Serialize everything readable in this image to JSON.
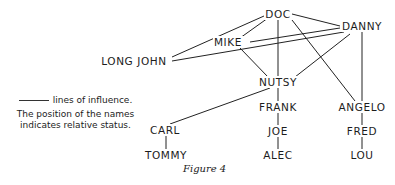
{
  "legend": {
    "line_label": "lines of influence.",
    "note_line1": "The position of the names",
    "note_line2": "indicates relative status."
  },
  "caption": "Figure 4",
  "nodes": {
    "doc": {
      "label": "DOC",
      "x": 278,
      "y": 14
    },
    "danny": {
      "label": "DANNY",
      "x": 362,
      "y": 26
    },
    "mike": {
      "label": "MIKE",
      "x": 228,
      "y": 42
    },
    "long_john": {
      "label": "LONG JOHN",
      "x": 134,
      "y": 61
    },
    "nutsy": {
      "label": "NUTSY",
      "x": 278,
      "y": 82
    },
    "frank": {
      "label": "FRANK",
      "x": 278,
      "y": 107
    },
    "angelo": {
      "label": "ANGELO",
      "x": 362,
      "y": 107
    },
    "carl": {
      "label": "CARL",
      "x": 165,
      "y": 130
    },
    "joe": {
      "label": "JOE",
      "x": 278,
      "y": 131
    },
    "fred": {
      "label": "FRED",
      "x": 362,
      "y": 131
    },
    "tommy": {
      "label": "TOMMY",
      "x": 166,
      "y": 155
    },
    "alec": {
      "label": "ALEC",
      "x": 278,
      "y": 155
    },
    "lou": {
      "label": "LOU",
      "x": 362,
      "y": 155
    }
  },
  "edges": [
    [
      "doc",
      "danny"
    ],
    [
      "doc",
      "mike"
    ],
    [
      "doc",
      "long_john"
    ],
    [
      "doc",
      "nutsy"
    ],
    [
      "doc",
      "angelo"
    ],
    [
      "danny",
      "mike"
    ],
    [
      "danny",
      "long_john"
    ],
    [
      "danny",
      "nutsy"
    ],
    [
      "danny",
      "angelo"
    ],
    [
      "mike",
      "nutsy"
    ],
    [
      "nutsy",
      "frank"
    ],
    [
      "nutsy",
      "carl"
    ],
    [
      "frank",
      "joe"
    ],
    [
      "joe",
      "alec"
    ],
    [
      "angelo",
      "fred"
    ],
    [
      "fred",
      "lou"
    ],
    [
      "carl",
      "tommy"
    ]
  ]
}
